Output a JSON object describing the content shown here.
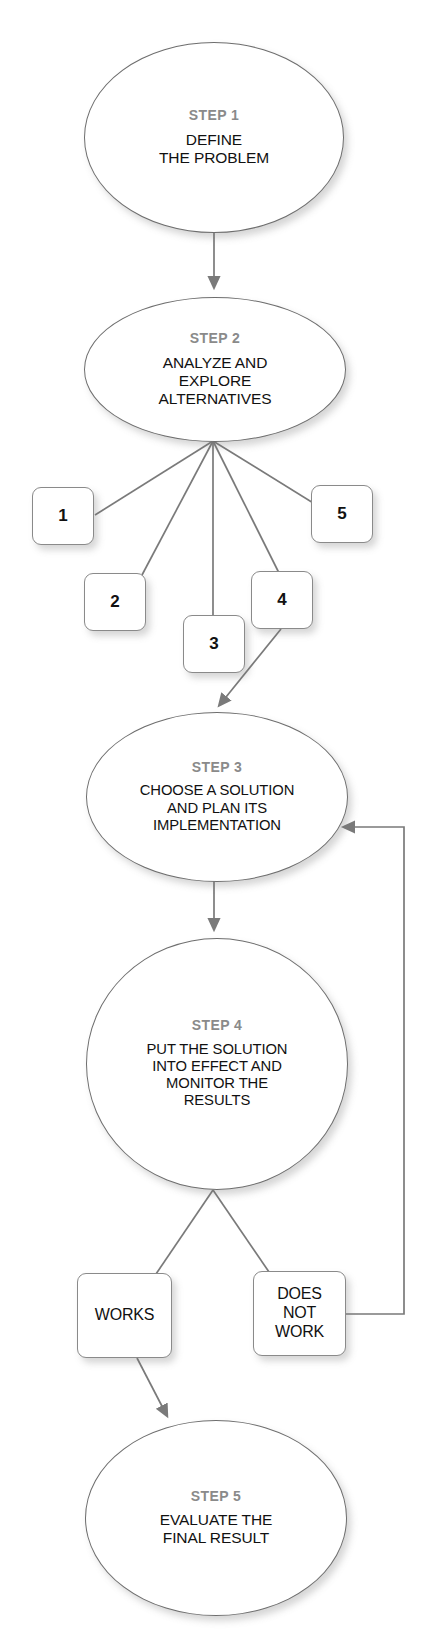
{
  "diagram": {
    "line_color": "#7a7a7a",
    "step_label_color": "#8a8a8a",
    "body_text_color": "#111111",
    "background": "#ffffff"
  },
  "steps": [
    {
      "id": "step-1",
      "label": "STEP 1",
      "text": "DEFINE\nTHE PROBLEM"
    },
    {
      "id": "step-2",
      "label": "STEP 2",
      "text": "ANALYZE AND\nEXPLORE\nALTERNATIVES"
    },
    {
      "id": "step-3",
      "label": "STEP 3",
      "text": "CHOOSE A SOLUTION\nAND PLAN ITS\nIMPLEMENTATION"
    },
    {
      "id": "step-4",
      "label": "STEP 4",
      "text": "PUT THE SOLUTION\nINTO EFFECT AND\nMONITOR THE\nRESULTS"
    },
    {
      "id": "step-5",
      "label": "STEP 5",
      "text": "EVALUATE THE\nFINAL RESULT"
    }
  ],
  "alternatives": [
    {
      "id": "alternative-1",
      "label": "1"
    },
    {
      "id": "alternative-2",
      "label": "2"
    },
    {
      "id": "alternative-3",
      "label": "3"
    },
    {
      "id": "alternative-4",
      "label": "4"
    },
    {
      "id": "alternative-5",
      "label": "5"
    }
  ],
  "outcomes": [
    {
      "id": "outcome-works",
      "label": "WORKS"
    },
    {
      "id": "outcome-does-not-work",
      "label": "DOES\nNOT\nWORK"
    }
  ],
  "connections": [
    {
      "from": "step-1",
      "to": "step-2",
      "kind": "arrow"
    },
    {
      "from": "step-2",
      "to": "alternative-1",
      "kind": "line"
    },
    {
      "from": "step-2",
      "to": "alternative-2",
      "kind": "line"
    },
    {
      "from": "step-2",
      "to": "alternative-3",
      "kind": "line"
    },
    {
      "from": "step-2",
      "to": "alternative-4",
      "kind": "line"
    },
    {
      "from": "step-2",
      "to": "alternative-5",
      "kind": "line"
    },
    {
      "from": "alternative-4",
      "to": "step-3",
      "kind": "arrow"
    },
    {
      "from": "step-3",
      "to": "step-4",
      "kind": "arrow"
    },
    {
      "from": "step-4",
      "to": "outcome-works",
      "kind": "line"
    },
    {
      "from": "step-4",
      "to": "outcome-does-not-work",
      "kind": "line"
    },
    {
      "from": "outcome-works",
      "to": "step-5",
      "kind": "arrow"
    },
    {
      "from": "outcome-does-not-work",
      "to": "step-3",
      "kind": "arrow-feedback"
    }
  ]
}
